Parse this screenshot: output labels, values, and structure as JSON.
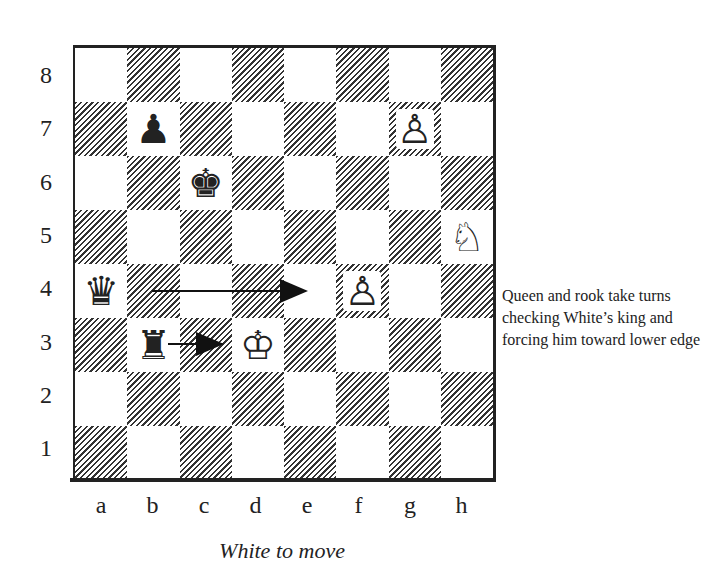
{
  "board": {
    "files": [
      "a",
      "b",
      "c",
      "d",
      "e",
      "f",
      "g",
      "h"
    ],
    "ranks": [
      "8",
      "7",
      "6",
      "5",
      "4",
      "3",
      "2",
      "1"
    ],
    "pieces": [
      {
        "square": "b7",
        "color": "black",
        "type": "pawn",
        "glyph": "♟"
      },
      {
        "square": "g7",
        "color": "white",
        "type": "pawn",
        "glyph": "♙"
      },
      {
        "square": "c6",
        "color": "black",
        "type": "king",
        "glyph": "♚"
      },
      {
        "square": "h5",
        "color": "white",
        "type": "knight",
        "glyph": "♘"
      },
      {
        "square": "a4",
        "color": "black",
        "type": "queen",
        "glyph": "♛"
      },
      {
        "square": "f4",
        "color": "white",
        "type": "pawn",
        "glyph": "♙"
      },
      {
        "square": "b3",
        "color": "black",
        "type": "rook",
        "glyph": "♜"
      },
      {
        "square": "d3",
        "color": "white",
        "type": "king",
        "glyph": "♔"
      }
    ],
    "arrows": [
      {
        "from": "b4",
        "to": "e4"
      },
      {
        "from": "b3",
        "to": "c3"
      }
    ]
  },
  "caption": "White to move",
  "note": "Queen and rook take turns checking White’s king and forcing him toward lower edge"
}
